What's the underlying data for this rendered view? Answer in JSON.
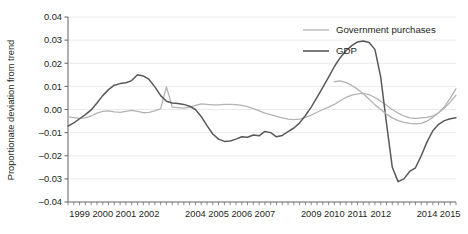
{
  "chart_data": {
    "type": "line",
    "title": "",
    "xlabel": "",
    "ylabel": "Proportionate deviation from trend",
    "ylim": [
      -0.04,
      0.04
    ],
    "xlim": [
      1999.0,
      2015.75
    ],
    "yticks": [
      "0.04",
      "0.03",
      "0.02",
      "0.01",
      "0.00",
      "-0.01",
      "-0.02",
      "-0.03",
      "-0.04"
    ],
    "ytick_values": [
      0.04,
      0.03,
      0.02,
      0.01,
      0.0,
      -0.01,
      -0.02,
      -0.03,
      -0.04
    ],
    "xticks": [
      "1999",
      "2000",
      "2001",
      "2002",
      "2004",
      "2005",
      "2006",
      "2007",
      "2009",
      "2010",
      "2011",
      "2012",
      "2014",
      "2015"
    ],
    "xtick_values": [
      1999,
      2000,
      2001,
      2002,
      2004,
      2005,
      2006,
      2007,
      2009,
      2010,
      2011,
      2012,
      2014,
      2015
    ],
    "minor_tick_interval": 0.25,
    "grid": "horizontal",
    "legend_position": "top-right",
    "x": [
      1999.0,
      1999.25,
      1999.5,
      1999.75,
      2000.0,
      2000.25,
      2000.5,
      2000.75,
      2001.0,
      2001.25,
      2001.5,
      2001.75,
      2002.0,
      2002.25,
      2002.5,
      2002.75,
      2003.0,
      2003.25,
      2003.5,
      2003.75,
      2004.0,
      2004.25,
      2004.5,
      2004.75,
      2005.0,
      2005.25,
      2005.5,
      2005.75,
      2006.0,
      2006.25,
      2006.5,
      2006.75,
      2007.0,
      2007.25,
      2007.5,
      2007.75,
      2008.0,
      2008.25,
      2008.5,
      2008.75,
      2009.0,
      2009.25,
      2009.5,
      2009.75,
      2010.0,
      2010.25,
      2010.5,
      2010.75,
      2011.0,
      2011.25,
      2011.5,
      2011.75,
      2012.0,
      2012.25,
      2012.5,
      2012.75,
      2013.0,
      2013.25,
      2013.5,
      2013.75,
      2014.0,
      2014.25,
      2014.5,
      2014.75,
      2015.0,
      2015.25,
      2015.5,
      2015.75
    ],
    "series": [
      {
        "name": "Government purchases",
        "color": "#b3b3b3",
        "width": 1.3,
        "values": [
          -0.0032,
          -0.0035,
          -0.0038,
          -0.0036,
          -0.0028,
          -0.0016,
          -0.0008,
          -0.0006,
          -0.001,
          -0.0012,
          -0.0008,
          -0.0004,
          -0.0008,
          -0.0014,
          -0.0012,
          -0.0006,
          0.0004,
          0.0098,
          0.001,
          0.0008,
          0.0006,
          0.001,
          0.0018,
          0.0024,
          0.0022,
          0.002,
          0.002,
          0.0022,
          0.0022,
          0.0021,
          0.0018,
          0.0012,
          0.0004,
          -0.0006,
          -0.0016,
          -0.0022,
          -0.003,
          -0.0036,
          -0.0042,
          -0.0044,
          -0.0042,
          -0.0034,
          -0.0024,
          -0.0012,
          0.0,
          0.001,
          0.0022,
          0.0038,
          0.0052,
          0.0062,
          0.0068,
          0.007,
          0.0064,
          0.0052,
          0.0036,
          0.0018,
          0.0,
          -0.0016,
          -0.0028,
          -0.0036,
          -0.0038,
          -0.0036,
          -0.0034,
          -0.0028,
          -0.0014,
          0.0006,
          0.0032,
          0.0062
        ]
      },
      {
        "name": "GDP",
        "color": "#58595b",
        "width": 1.5,
        "values": [
          -0.0072,
          -0.0058,
          -0.004,
          -0.0022,
          -0.0002,
          0.0028,
          0.006,
          0.0086,
          0.0105,
          0.0112,
          0.0116,
          0.0125,
          0.015,
          0.0145,
          0.013,
          0.0098,
          0.006,
          0.0036,
          0.0028,
          0.0026,
          0.0022,
          0.0014,
          0.0,
          -0.003,
          -0.007,
          -0.0106,
          -0.0128,
          -0.0138,
          -0.0136,
          -0.0128,
          -0.0118,
          -0.012,
          -0.011,
          -0.0114,
          -0.0095,
          -0.01,
          -0.0118,
          -0.0112,
          -0.0096,
          -0.008,
          -0.0058,
          -0.0026,
          0.001,
          0.0052,
          0.0096,
          0.014,
          0.0186,
          0.0224,
          0.0254,
          0.0276,
          0.0292,
          0.0296,
          0.029,
          0.026,
          0.014,
          -0.006,
          -0.025,
          -0.0312,
          -0.03,
          -0.0268,
          -0.0252,
          -0.02,
          -0.014,
          -0.0092,
          -0.0064,
          -0.0048,
          -0.004,
          -0.0036
        ]
      }
    ],
    "series_tail": [
      {
        "name": "Government purchases",
        "x": [
          2010.5,
          2010.75,
          2011.0,
          2011.25,
          2011.5,
          2011.75,
          2012.0,
          2012.25,
          2012.5,
          2012.75,
          2013.0,
          2013.25,
          2013.5,
          2013.75,
          2014.0,
          2014.25,
          2014.5,
          2014.75,
          2015.0,
          2015.25,
          2015.5,
          2015.75
        ],
        "values": [
          0.012,
          0.0124,
          0.0116,
          0.0104,
          0.0088,
          0.0068,
          0.0044,
          0.002,
          0.0,
          -0.002,
          -0.0036,
          -0.0048,
          -0.0056,
          -0.006,
          -0.0062,
          -0.006,
          -0.005,
          -0.0034,
          -0.0014,
          0.0012,
          0.0048,
          0.009
        ]
      }
    ],
    "legend": [
      {
        "label": "Government purchases",
        "color": "#b3b3b3"
      },
      {
        "label": "GDP",
        "color": "#58595b"
      }
    ],
    "colors": {
      "gridline": "#e8e8e8",
      "axis": "#6d6e71",
      "text": "#231f20",
      "background": "#ffffff"
    }
  }
}
